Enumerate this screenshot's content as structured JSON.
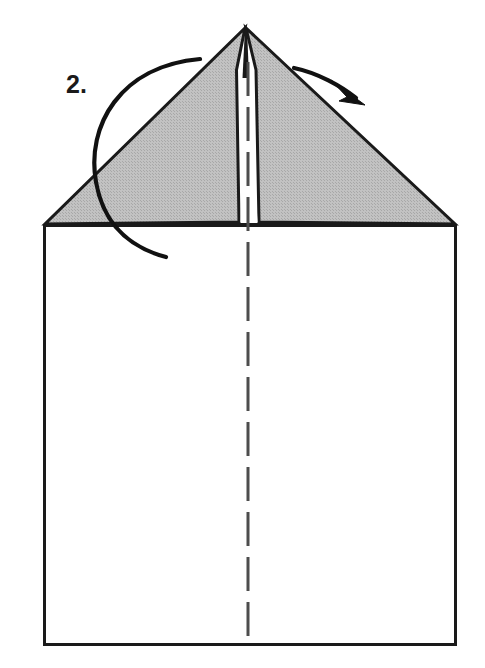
{
  "figure": {
    "kind": "origami-fold-diagram",
    "step_label": "2.",
    "step_label_position": {
      "x": 66,
      "y": 72
    },
    "canvas": {
      "width": 485,
      "height": 668
    },
    "colors": {
      "paper_fill": "#ffffff",
      "flap_fill": "#b9b9b9",
      "outline": "#1a1a1a",
      "crease_line": "#4d4d4d",
      "arrow": "#111111",
      "background": "#ffffff"
    },
    "shapes": {
      "sheet": {
        "name": "paper-sheet",
        "left": 43,
        "right": 456,
        "top": 224,
        "bottom": 645,
        "stroke_width": 3
      },
      "left_flap": {
        "name": "left-folded-flap",
        "points": "245,28 236,70 239,222 45,224 245,28"
      },
      "right_flap": {
        "name": "right-folded-flap",
        "points": "245,28 256,70 259,222 455,224 245,28"
      },
      "center_notch": {
        "name": "center-notch-gap",
        "points": "245,28 239,222 259,222 247,28",
        "apex_x": 245,
        "apex_y": 28,
        "base_left_x": 239,
        "base_right_x": 259,
        "base_y": 222
      },
      "center_crease": {
        "name": "center-crease-dashed-line",
        "x": 248,
        "y_top": 62,
        "y_bottom": 645,
        "dash": "34 11",
        "stroke_width": 3
      }
    },
    "arrows": [
      {
        "name": "left-fold-arc-arrow",
        "type": "open-arc",
        "path": "M 200,59 C 120,66 86,126 96,182 C 104,227 132,248 166,257",
        "stroke_width": 4.2,
        "has_arrowhead": false
      },
      {
        "name": "right-fold-arrow",
        "type": "curved-arrow",
        "path": "M 294,68 C 318,74 342,86 357,99",
        "stroke_width": 4.2,
        "has_arrowhead": true,
        "arrowhead_tip": {
          "x": 364,
          "y": 104
        },
        "arrowhead_points": "364,104 333,82 348,96 340,100"
      }
    ]
  }
}
